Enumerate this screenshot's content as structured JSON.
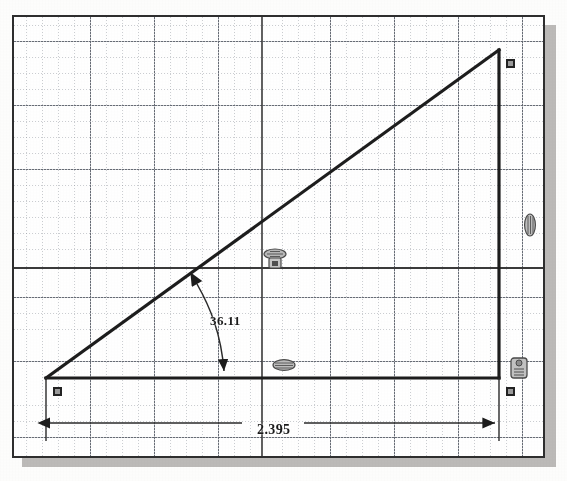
{
  "app": {
    "kind": "cad-sketch",
    "background_color": "#fdfdfc",
    "paper_color": "#ffffff",
    "frame_border_color": "#2e2e2e",
    "shadow_color": "#b0aeab"
  },
  "sketch": {
    "geometry_color": "#202020",
    "grid_color": "#7d828c",
    "point_fill": "#9a9a9a",
    "point_stroke": "#222222",
    "entities": [
      {
        "name": "base-line",
        "type": "line",
        "x1": 44,
        "y1": 375,
        "x2": 497,
        "y2": 375
      },
      {
        "name": "vertical-line",
        "type": "line",
        "x1": 497,
        "y1": 47,
        "x2": 497,
        "y2": 375
      },
      {
        "name": "hypotenuse-line",
        "type": "line",
        "x1": 44,
        "y1": 375,
        "x2": 497,
        "y2": 47
      }
    ],
    "points": [
      {
        "name": "origin-point",
        "x": 44,
        "y": 375
      },
      {
        "name": "top-right-point",
        "x": 497,
        "y": 47
      },
      {
        "name": "bottom-right-point",
        "x": 497,
        "y": 375
      }
    ]
  },
  "dimensions": {
    "angle": {
      "label": "36.11",
      "unit": "degrees",
      "between": [
        "base-line",
        "hypotenuse-line"
      ],
      "arc_from": {
        "x": 195,
        "y": 281
      },
      "arc_to": {
        "x": 222,
        "y": 372
      }
    },
    "length": {
      "label": "2.395",
      "unit": "inches",
      "measures": "base-line",
      "extension_left_x": 44,
      "extension_right_x": 497,
      "dimension_line_y": 420
    }
  },
  "relations": [
    {
      "name": "coincident-relation-hypotenuse",
      "icon": "coincident-icon",
      "label": "Coincident",
      "x": 256,
      "y": 240
    },
    {
      "name": "horizontal-relation-base",
      "icon": "horizontal-icon",
      "label": "Horizontal",
      "x": 266,
      "y": 348
    },
    {
      "name": "vertical-relation-right",
      "icon": "vertical-icon",
      "label": "Vertical",
      "x": 514,
      "y": 207
    },
    {
      "name": "coincident-relation-corner",
      "icon": "coincident-icon",
      "label": "Coincident",
      "x": 502,
      "y": 350
    }
  ],
  "grid": {
    "minor_spacing": 16,
    "major_spacing": 64,
    "origin_x": 260,
    "origin_y": 265,
    "style": "dotted"
  }
}
